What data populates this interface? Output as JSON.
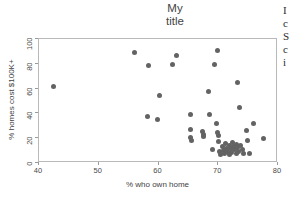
{
  "chart_data": {
    "type": "scatter",
    "title": "My\ntitle",
    "xlabel": "% who own home",
    "ylabel": "% homes cost $100K+",
    "xlim": [
      40,
      80
    ],
    "ylim": [
      0,
      100
    ],
    "xticks": [
      40,
      50,
      60,
      70,
      80
    ],
    "yticks": [
      0,
      20,
      40,
      60,
      80,
      100
    ],
    "grid": false,
    "legend": null,
    "marker_color": "#636363",
    "frame_color": "#b9b9b9",
    "series": [
      {
        "name": "states",
        "points": [
          [
            42.5,
            62.0
          ],
          [
            56.0,
            89.0
          ],
          [
            58.4,
            79.0
          ],
          [
            58.2,
            37.5
          ],
          [
            59.8,
            34.8
          ],
          [
            60.2,
            54.5
          ],
          [
            62.3,
            79.8
          ],
          [
            63.0,
            87.0
          ],
          [
            65.4,
            38.8
          ],
          [
            65.3,
            27.2
          ],
          [
            65.4,
            20.5
          ],
          [
            65.5,
            18.2
          ],
          [
            67.3,
            25.8
          ],
          [
            67.5,
            23.0
          ],
          [
            67.6,
            21.0
          ],
          [
            68.6,
            39.0
          ],
          [
            68.4,
            57.8
          ],
          [
            69.4,
            79.5
          ],
          [
            69.8,
            91.0
          ],
          [
            69.0,
            11.0
          ],
          [
            69.7,
            31.5
          ],
          [
            69.9,
            24.5
          ],
          [
            70.0,
            22.5
          ],
          [
            70.1,
            17.0
          ],
          [
            70.2,
            9.0
          ],
          [
            70.4,
            6.5
          ],
          [
            70.7,
            13.5
          ],
          [
            70.8,
            10.0
          ],
          [
            71.0,
            7.5
          ],
          [
            71.2,
            15.5
          ],
          [
            71.4,
            12.0
          ],
          [
            71.5,
            9.0
          ],
          [
            71.8,
            6.8
          ],
          [
            71.9,
            14.0
          ],
          [
            72.1,
            11.5
          ],
          [
            72.3,
            8.5
          ],
          [
            72.4,
            16.5
          ],
          [
            72.6,
            13.0
          ],
          [
            72.8,
            10.5
          ],
          [
            73.0,
            7.8
          ],
          [
            73.1,
            15.0
          ],
          [
            73.2,
            12.2
          ],
          [
            73.4,
            9.5
          ],
          [
            73.6,
            44.5
          ],
          [
            73.2,
            65.0
          ],
          [
            73.8,
            13.8
          ],
          [
            74.0,
            11.0
          ],
          [
            74.3,
            8.0
          ],
          [
            74.8,
            26.0
          ],
          [
            74.9,
            18.0
          ],
          [
            75.2,
            7.5
          ],
          [
            75.9,
            32.0
          ],
          [
            77.5,
            19.8
          ]
        ]
      }
    ]
  },
  "side_text": {
    "lines": [
      "I",
      "c",
      "S",
      "c",
      "i"
    ]
  }
}
